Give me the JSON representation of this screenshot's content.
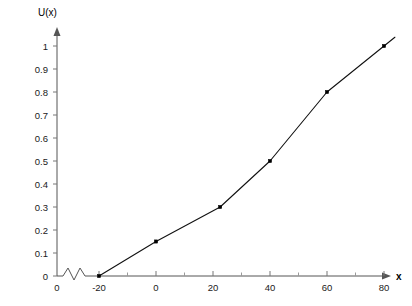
{
  "chart_data": {
    "type": "line",
    "title": "",
    "xlabel": "x",
    "ylabel": "U(x)",
    "x": [
      -20,
      0,
      22.5,
      40,
      60,
      80
    ],
    "values": [
      0,
      0.15,
      0.3,
      0.5,
      0.8,
      1.0
    ],
    "series": [
      {
        "name": "U(x)",
        "points": [
          {
            "x": -20,
            "y": 0
          },
          {
            "x": 0,
            "y": 0.15
          },
          {
            "x": 22.5,
            "y": 0.3
          },
          {
            "x": 40,
            "y": 0.5
          },
          {
            "x": 60,
            "y": 0.8
          },
          {
            "x": 80,
            "y": 1.0
          }
        ]
      }
    ],
    "xlim": [
      -30,
      88
    ],
    "ylim": [
      0,
      1.05
    ],
    "xticks": [
      -20,
      0,
      20,
      40,
      60,
      80
    ],
    "xtick_labels": [
      "-20",
      "0",
      "20",
      "40",
      "60",
      "80"
    ],
    "x_minor_ticks": [
      -10,
      10,
      30,
      50,
      70
    ],
    "yticks": [
      0,
      0.1,
      0.2,
      0.3,
      0.4,
      0.5,
      0.6,
      0.7,
      0.8,
      0.9,
      1.0
    ],
    "ytick_labels": [
      "0",
      "0.1",
      "0.2",
      "0.3",
      "0.4",
      "0.5",
      "0.6",
      "0.7",
      "0.8",
      "0.9",
      "1"
    ],
    "grid": false,
    "legend": false,
    "legend_position": "none",
    "axis_break": {
      "axis": "x",
      "symbol": "zigzag",
      "origin_label": "0"
    },
    "marker": "square",
    "line_color": "#111111",
    "marker_color": "#000000",
    "axis_color": "#555555",
    "background_color": "#ffffff"
  },
  "axes": {
    "y_title": "U(x)",
    "x_title": "x",
    "origin_label": "0"
  },
  "y_labels": {
    "t0": "0",
    "t1": "0.1",
    "t2": "0.2",
    "t3": "0.3",
    "t4": "0.4",
    "t5": "0.5",
    "t6": "0.6",
    "t7": "0.7",
    "t8": "0.8",
    "t9": "0.9",
    "t10": "1"
  },
  "x_labels": {
    "t0": "-20",
    "t1": "0",
    "t2": "20",
    "t3": "40",
    "t4": "60",
    "t5": "80"
  }
}
